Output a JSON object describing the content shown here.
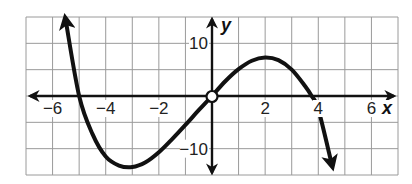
{
  "chart_data": {
    "type": "line",
    "title": "",
    "xlabel": "x",
    "ylabel": "y",
    "xlim": [
      -7,
      7
    ],
    "ylim": [
      -15,
      15
    ],
    "grid": true,
    "x_grid_step": 1,
    "y_grid_step": 5,
    "x_tick_labels": [
      {
        "value": -6,
        "label": "−6"
      },
      {
        "value": -4,
        "label": "−4"
      },
      {
        "value": -2,
        "label": "−2"
      },
      {
        "value": 2,
        "label": "2"
      },
      {
        "value": 4,
        "label": "4"
      },
      {
        "value": 6,
        "label": "6"
      }
    ],
    "y_tick_labels": [
      {
        "value": 10,
        "label": "10"
      },
      {
        "value": -10,
        "label": "−10"
      }
    ],
    "series": [
      {
        "name": "cubic function",
        "x": [
          -5.5,
          -5,
          -4.5,
          -4,
          -3.5,
          -3,
          -2.5,
          -2,
          -1.5,
          -1,
          -0.5,
          0,
          0.5,
          1,
          1.5,
          2,
          2.5,
          3,
          3.5,
          3.75,
          4,
          4.5
        ],
        "y": [
          14.2,
          0,
          -7.2,
          -11.5,
          -13.2,
          -13.5,
          -12.6,
          -10.7,
          -8.2,
          -5.5,
          -2.7,
          0,
          2.8,
          5.1,
          6.7,
          7.3,
          6.8,
          5,
          1.9,
          0,
          -2.5,
          -12.8
        ]
      }
    ],
    "roots": [
      -5,
      0,
      3.75
    ],
    "local_max": {
      "x": 2,
      "y": 7.3
    },
    "local_min": {
      "x": -3,
      "y": -13.5
    },
    "open_point": {
      "x": 0,
      "y": 0
    },
    "end_behavior": "arrows at both ends: up-left, down-right"
  },
  "labels": {
    "x_axis_name": "x",
    "y_axis_name": "y",
    "x_ticks": [
      "−6",
      "−4",
      "−2",
      "2",
      "4",
      "6"
    ],
    "y_tick_pos": "10",
    "y_tick_neg": "−10"
  },
  "colors": {
    "curve": "#111111",
    "grid": "#9a9a9a",
    "axis": "#111111",
    "background": "#ffffff"
  }
}
